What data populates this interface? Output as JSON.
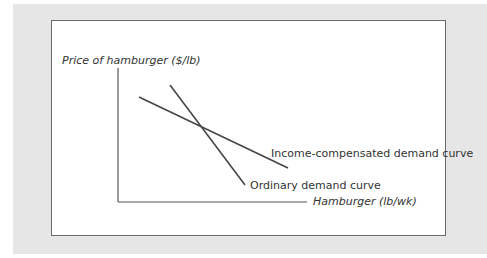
{
  "diagram": {
    "y_axis_label": "Price of hamburger ($/lb)",
    "x_axis_label": "Hamburger (lb/wk)",
    "curves": [
      {
        "name": "Income-compensated demand curve",
        "slope": "flatter"
      },
      {
        "name": "Ordinary demand curve",
        "slope": "steeper"
      }
    ]
  },
  "labels": {
    "ylabel": "Price of hamburger ($/lb)",
    "xlabel": "Hamburger (lb/wk)",
    "income_compensated": "Income-compensated demand curve",
    "ordinary": "Ordinary demand curve"
  }
}
